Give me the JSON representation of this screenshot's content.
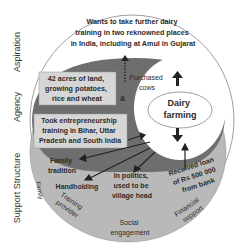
{
  "side_labels": {
    "aspiration": "Aspiration",
    "agency": "Agency",
    "support_structure": "Support Structure"
  },
  "aspiration": {
    "lines": [
      "Wants to take further dairy",
      "training in two reknowned places",
      "in India, including at Amul in Gujarat"
    ]
  },
  "agency": {
    "land_box": [
      "42 acres of land,",
      "growing potatoes,",
      "rice and wheat"
    ],
    "ampersand": "&",
    "purchased": [
      "Purchased",
      "cows"
    ],
    "training_box": [
      "Took entrepreneurship",
      "training in Bihar, Uttar",
      "Pradesh and South India"
    ]
  },
  "center": {
    "lines": [
      "Dairy",
      "farming"
    ]
  },
  "support": {
    "family_tradition": [
      "Family",
      "tradition"
    ],
    "handholding": "Handholding",
    "politics": [
      "In politics,",
      "used to be",
      "village head"
    ],
    "loan": [
      "Received loan",
      "of Rs 500 000",
      "from bank"
    ],
    "edge_labels": {
      "family": "Family",
      "training_provider": [
        "Training",
        "provider"
      ],
      "social_engagement": [
        "Social",
        "engagement"
      ],
      "financial_support": [
        "Financial",
        "support"
      ]
    }
  },
  "colors": {
    "aspiration_fill": "#ffffff",
    "agency_fill": "#6e6e6e",
    "support_fill": "#b9b9b9",
    "box_fill": "#d6d6d6",
    "center_fill": "#ffffff"
  }
}
